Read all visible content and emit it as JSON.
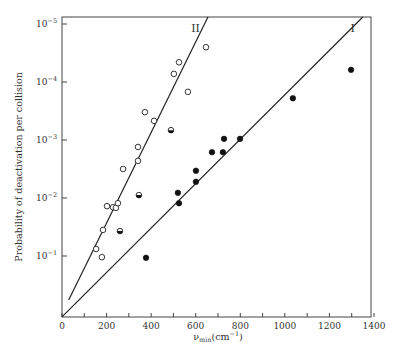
{
  "chart_data": {
    "type": "scatter",
    "title": "",
    "xlabel": "ν_min(cm⁻¹)",
    "xlabel_parts": {
      "main": "ν",
      "sub": "min",
      "unit": "(cm",
      "unit_sup": "−1",
      "close": ")"
    },
    "ylabel": "Probability of deactivation per collision",
    "y_scale": "log",
    "xlim": [
      0,
      1400
    ],
    "ylim_exponent": [
      0.05,
      -5.12
    ],
    "x_ticks": [
      0,
      200,
      400,
      600,
      800,
      1000,
      1200,
      1400
    ],
    "x_minor_step": 100,
    "y_ticks": [
      {
        "exponent": -5,
        "base": "10",
        "sup": "−5"
      },
      {
        "exponent": -4,
        "base": "10",
        "sup": "−4"
      },
      {
        "exponent": -3,
        "base": "10",
        "sup": "−3"
      },
      {
        "exponent": -2,
        "base": "10",
        "sup": "−2"
      },
      {
        "exponent": -1,
        "base": "10",
        "sup": "−1"
      }
    ],
    "grid": false,
    "series": [
      {
        "name": "II",
        "marker": "open-circle",
        "points": [
          [
            202,
            -1.86
          ],
          [
            229,
            -1.84
          ],
          [
            242,
            -1.83
          ],
          [
            251,
            -1.91
          ],
          [
            184,
            -1.45
          ],
          [
            153,
            -1.12
          ],
          [
            179,
            -0.98
          ],
          [
            274,
            -2.5
          ],
          [
            341,
            -2.64
          ],
          [
            341,
            -2.88
          ],
          [
            413,
            -3.33
          ],
          [
            372,
            -3.48
          ],
          [
            502,
            -4.14
          ],
          [
            525,
            -4.34
          ],
          [
            565,
            -3.83
          ],
          [
            646,
            -4.6
          ]
        ],
        "fit_line": [
          [
            30,
            -0.24
          ],
          [
            655,
            -5.12
          ]
        ]
      },
      {
        "name": "I",
        "marker": "filled-circle",
        "points": [
          [
            377,
            -0.97
          ],
          [
            520,
            -2.09
          ],
          [
            525,
            -1.91
          ],
          [
            601,
            -2.28
          ],
          [
            601,
            -2.47
          ],
          [
            673,
            -2.79
          ],
          [
            722,
            -2.79
          ],
          [
            727,
            -3.02
          ],
          [
            799,
            -3.02
          ],
          [
            1036,
            -3.72
          ],
          [
            1297,
            -4.21
          ]
        ],
        "fit_line": [
          [
            0,
            0.05
          ],
          [
            1350,
            -5.12
          ]
        ]
      },
      {
        "name": "mixed",
        "marker": "half-filled-circle",
        "points": [
          [
            260,
            -1.43
          ],
          [
            345,
            -2.05
          ],
          [
            489,
            -3.17
          ]
        ]
      }
    ],
    "annotations": [
      {
        "text": "II",
        "attach": "line-II-top"
      },
      {
        "text": "I",
        "attach": "line-I-top"
      }
    ]
  }
}
